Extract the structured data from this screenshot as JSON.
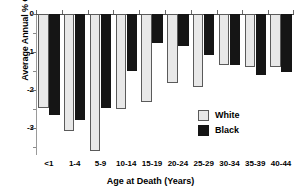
{
  "chart_data": {
    "type": "bar",
    "title": "",
    "xlabel": "Age at Death (Years)",
    "ylabel": "Average Annual % Change",
    "categories": [
      "<1",
      "1-4",
      "5-9",
      "10-14",
      "15-19",
      "20-24",
      "25-29",
      "30-34",
      "35-39",
      "40-44"
    ],
    "series": [
      {
        "name": "White",
        "color": "#e8e8e8",
        "values": [
          -2.46,
          -3.08,
          -3.6,
          -2.5,
          -2.3,
          -1.8,
          -1.92,
          -1.33,
          -1.4,
          -1.38
        ]
      },
      {
        "name": "Black",
        "color": "#151515",
        "values": [
          -2.64,
          -2.77,
          -2.46,
          -1.49,
          -0.77,
          -0.85,
          -1.07,
          -1.33,
          -1.6,
          -1.52
        ]
      }
    ],
    "ylim": [
      -3.7,
      0
    ],
    "ytick_values": [
      0,
      -1,
      -2,
      -3
    ],
    "ytick_labels": [
      "0",
      "-1",
      "-2",
      "-3"
    ],
    "yminor_values": [
      -0.5,
      -1.5,
      -2.5,
      -3.5
    ],
    "grid": false,
    "legend_position": "inside-right"
  },
  "legend": {
    "entries": [
      {
        "label": "White",
        "swatch": "white-swatch"
      },
      {
        "label": "Black",
        "swatch": "black-swatch"
      }
    ]
  }
}
